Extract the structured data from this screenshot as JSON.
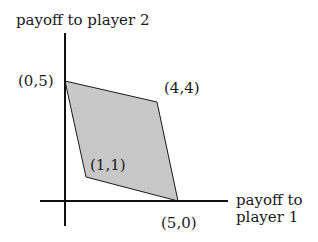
{
  "diagram": {
    "type": "payoff-region",
    "y_axis_label": "payoff to player 2",
    "x_axis_label_line1": "payoff to",
    "x_axis_label_line2": "player 1",
    "points": [
      {
        "label": "(0,5)",
        "x": 0,
        "y": 5
      },
      {
        "label": "(4,4)",
        "x": 4,
        "y": 4
      },
      {
        "label": "(5,0)",
        "x": 5,
        "y": 0
      },
      {
        "label": "(1,1)",
        "x": 1,
        "y": 1
      }
    ],
    "fill_color": "#c8c8c8",
    "stroke_color": "#1a1a1a"
  }
}
